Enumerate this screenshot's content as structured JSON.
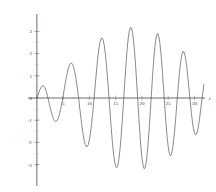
{
  "chart_data": {
    "type": "line",
    "title": "",
    "subtitle": "",
    "xlabel": "t",
    "ylabel": "",
    "xlim": [
      -1.5,
      32
    ],
    "ylim": [
      -3.6,
      3.6
    ],
    "grid": false,
    "legend": null,
    "x_ticks": [
      5,
      10,
      15,
      20,
      25,
      30
    ],
    "x_tick_labels": [
      "5",
      "10",
      "15",
      "20",
      "25",
      "30"
    ],
    "y_ticks": [
      -3,
      -2,
      -1,
      0,
      1,
      2,
      3
    ],
    "y_tick_labels": [
      "-3",
      "-2",
      "-1",
      "0",
      "1",
      "2",
      "3"
    ],
    "series": [
      {
        "name": "beat-oscillation",
        "color": "#4a4a4a",
        "description": "Amplitude-modulated oscillation: envelope grows from 0, peaks near t=15 at about 3.4, then decays toward 0 near t=30",
        "envelope_peak_t": 15.5,
        "envelope_peak_value": 3.45,
        "carrier_period": 2.6,
        "points": [
          [
            0.0,
            0.0
          ],
          [
            0.2,
            0.12
          ],
          [
            0.4,
            0.26
          ],
          [
            0.6,
            0.39
          ],
          [
            0.8,
            0.48
          ],
          [
            1.0,
            0.54
          ],
          [
            1.2,
            0.55
          ],
          [
            1.4,
            0.51
          ],
          [
            1.6,
            0.42
          ],
          [
            1.8,
            0.28
          ],
          [
            2.0,
            0.11
          ],
          [
            2.2,
            -0.09
          ],
          [
            2.4,
            -0.3
          ],
          [
            2.6,
            -0.5
          ],
          [
            2.8,
            -0.68
          ],
          [
            3.0,
            -0.84
          ],
          [
            3.2,
            -0.96
          ],
          [
            3.4,
            -1.03
          ],
          [
            3.6,
            -1.06
          ],
          [
            3.8,
            -1.03
          ],
          [
            4.0,
            -0.95
          ],
          [
            4.2,
            -0.82
          ],
          [
            4.4,
            -0.64
          ],
          [
            4.6,
            -0.42
          ],
          [
            4.8,
            -0.17
          ],
          [
            5.0,
            0.1
          ],
          [
            5.2,
            0.38
          ],
          [
            5.4,
            0.66
          ],
          [
            5.6,
            0.92
          ],
          [
            5.8,
            1.15
          ],
          [
            6.0,
            1.34
          ],
          [
            6.2,
            1.48
          ],
          [
            6.4,
            1.56
          ],
          [
            6.6,
            1.57
          ],
          [
            6.8,
            1.51
          ],
          [
            7.0,
            1.38
          ],
          [
            7.2,
            1.19
          ],
          [
            7.4,
            0.93
          ],
          [
            7.6,
            0.62
          ],
          [
            7.8,
            0.26
          ],
          [
            8.0,
            -0.12
          ],
          [
            8.2,
            -0.53
          ],
          [
            8.4,
            -0.93
          ],
          [
            8.6,
            -1.31
          ],
          [
            8.8,
            -1.64
          ],
          [
            9.0,
            -1.91
          ],
          [
            9.2,
            -2.09
          ],
          [
            9.4,
            -2.19
          ],
          [
            9.6,
            -2.18
          ],
          [
            9.8,
            -2.08
          ],
          [
            10.0,
            -1.87
          ],
          [
            10.2,
            -1.57
          ],
          [
            10.4,
            -1.19
          ],
          [
            10.6,
            -0.74
          ],
          [
            10.8,
            -0.24
          ],
          [
            11.0,
            0.29
          ],
          [
            11.2,
            0.83
          ],
          [
            11.4,
            1.35
          ],
          [
            11.6,
            1.82
          ],
          [
            11.8,
            2.21
          ],
          [
            12.0,
            2.5
          ],
          [
            12.2,
            2.67
          ],
          [
            12.4,
            2.71
          ],
          [
            12.6,
            2.62
          ],
          [
            12.8,
            2.4
          ],
          [
            13.0,
            2.05
          ],
          [
            13.2,
            1.59
          ],
          [
            13.4,
            1.04
          ],
          [
            13.6,
            0.43
          ],
          [
            13.8,
            -0.21
          ],
          [
            14.0,
            -0.87
          ],
          [
            14.2,
            -1.49
          ],
          [
            14.4,
            -2.05
          ],
          [
            14.6,
            -2.52
          ],
          [
            14.8,
            -2.87
          ],
          [
            15.0,
            -3.08
          ],
          [
            15.2,
            -3.14
          ],
          [
            15.4,
            -3.04
          ],
          [
            15.6,
            -2.78
          ],
          [
            15.8,
            -2.37
          ],
          [
            16.0,
            -1.84
          ],
          [
            16.2,
            -1.2
          ],
          [
            16.4,
            -0.5
          ],
          [
            16.6,
            0.24
          ],
          [
            16.8,
            0.97
          ],
          [
            17.0,
            1.65
          ],
          [
            17.2,
            2.24
          ],
          [
            17.4,
            2.71
          ],
          [
            17.6,
            3.03
          ],
          [
            17.8,
            3.18
          ],
          [
            18.0,
            3.15
          ],
          [
            18.2,
            2.95
          ],
          [
            18.4,
            2.58
          ],
          [
            18.6,
            2.06
          ],
          [
            18.8,
            1.42
          ],
          [
            19.0,
            0.69
          ],
          [
            19.2,
            -0.08
          ],
          [
            19.4,
            -0.85
          ],
          [
            19.6,
            -1.57
          ],
          [
            19.8,
            -2.2
          ],
          [
            20.0,
            -2.7
          ],
          [
            20.2,
            -3.03
          ],
          [
            20.4,
            -3.18
          ],
          [
            20.6,
            -3.14
          ],
          [
            20.8,
            -2.91
          ],
          [
            21.0,
            -2.51
          ],
          [
            21.2,
            -1.96
          ],
          [
            21.4,
            -1.3
          ],
          [
            21.6,
            -0.57
          ],
          [
            21.8,
            0.18
          ],
          [
            22.0,
            0.92
          ],
          [
            22.2,
            1.59
          ],
          [
            22.4,
            2.16
          ],
          [
            22.6,
            2.58
          ],
          [
            22.8,
            2.83
          ],
          [
            23.0,
            2.9
          ],
          [
            23.2,
            2.78
          ],
          [
            23.4,
            2.49
          ],
          [
            23.6,
            2.04
          ],
          [
            23.8,
            1.47
          ],
          [
            24.0,
            0.81
          ],
          [
            24.2,
            0.12
          ],
          [
            24.4,
            -0.57
          ],
          [
            24.6,
            -1.21
          ],
          [
            24.8,
            -1.77
          ],
          [
            25.0,
            -2.2
          ],
          [
            25.2,
            -2.48
          ],
          [
            25.4,
            -2.6
          ],
          [
            25.6,
            -2.55
          ],
          [
            25.8,
            -2.34
          ],
          [
            26.0,
            -1.99
          ],
          [
            26.2,
            -1.52
          ],
          [
            26.4,
            -0.97
          ],
          [
            26.6,
            -0.38
          ],
          [
            26.8,
            0.22
          ],
          [
            27.0,
            0.79
          ],
          [
            27.2,
            1.29
          ],
          [
            27.4,
            1.69
          ],
          [
            27.6,
            1.96
          ],
          [
            27.8,
            2.09
          ],
          [
            28.0,
            2.07
          ],
          [
            28.2,
            1.91
          ],
          [
            28.4,
            1.63
          ],
          [
            28.6,
            1.25
          ],
          [
            28.8,
            0.8
          ],
          [
            29.0,
            0.31
          ],
          [
            29.2,
            -0.18
          ],
          [
            29.4,
            -0.65
          ],
          [
            29.6,
            -1.05
          ],
          [
            29.8,
            -1.37
          ],
          [
            30.0,
            -1.58
          ],
          [
            30.2,
            -1.66
          ],
          [
            30.4,
            -1.62
          ],
          [
            30.6,
            -1.46
          ],
          [
            30.8,
            -1.2
          ],
          [
            31.0,
            -0.86
          ],
          [
            31.2,
            -0.48
          ],
          [
            31.4,
            -0.09
          ],
          [
            31.6,
            0.28
          ],
          [
            31.8,
            0.61
          ]
        ]
      }
    ]
  }
}
